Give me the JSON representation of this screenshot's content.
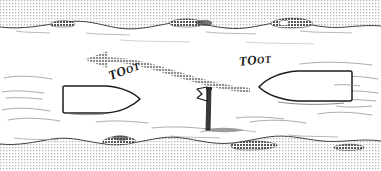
{
  "scene": {
    "title": "Two boats passing a channel marker",
    "width": 381,
    "height": 171,
    "background_color": "#ffffff",
    "ink_color": "#1a1a1a",
    "arrow_color": "#9a9a9a",
    "bank_fill_color": "#d8d8d8"
  },
  "labels": {
    "toot_left": {
      "lead": "TO",
      "trail": "OT",
      "full": "TOOT"
    },
    "toot_right": {
      "lead": "TO",
      "trail": "OT",
      "full": "TOOT"
    }
  },
  "objects": {
    "top_bank": {
      "name": "upper riverbank",
      "position": "top edge"
    },
    "bottom_bank": {
      "name": "lower riverbank",
      "position": "bottom edge"
    },
    "left_boat": {
      "name": "left boat",
      "heading": "right",
      "bow_x": 140,
      "stern_x": 62
    },
    "right_boat": {
      "name": "right boat",
      "heading": "left",
      "bow_x": 260,
      "stern_x": 350
    },
    "marker_post": {
      "name": "channel marker post with vane",
      "x": 207,
      "y": 86
    },
    "path_arrow": {
      "name": "curved course arrow",
      "direction": "left"
    }
  }
}
